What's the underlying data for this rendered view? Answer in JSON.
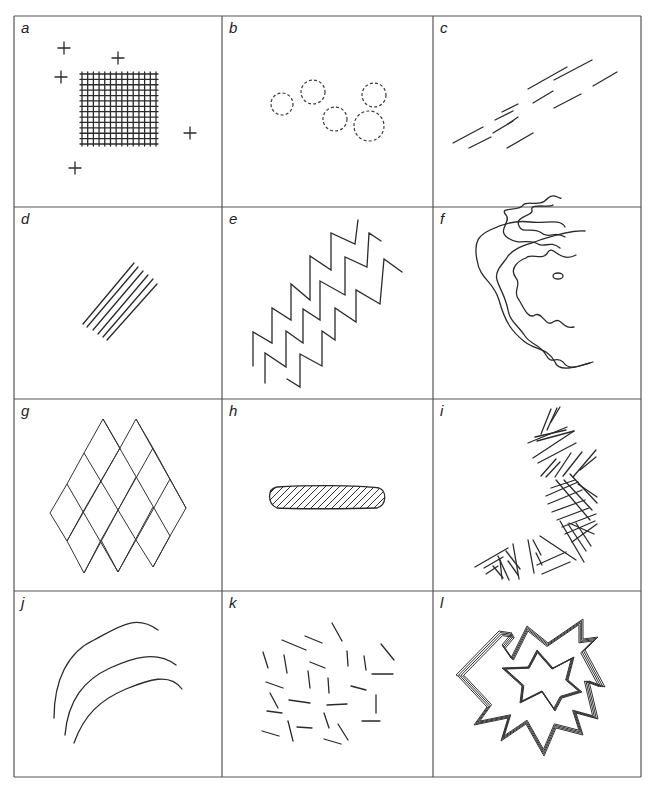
{
  "figure": {
    "type": "pattern-panel-grid",
    "rows": 4,
    "cols": 3,
    "frame": {
      "x0": 14,
      "y0": 16,
      "x1": 641,
      "y1": 777
    },
    "col_lines": [
      14,
      222,
      433,
      641
    ],
    "row_lines": [
      16,
      207,
      399,
      591,
      777
    ],
    "stroke_color": "#2a2a2a",
    "border_color": "#555555"
  },
  "panels": [
    {
      "id": "a",
      "label": "a",
      "description": "dense cross-hatched grid with scattered plus marks",
      "grid": {
        "x0": 80,
        "y0": 72,
        "x1": 158,
        "y1": 146,
        "vlines": 14,
        "hlines": 14
      },
      "plus_marks": [
        [
          64,
          48
        ],
        [
          118,
          58
        ],
        [
          61,
          77
        ],
        [
          190,
          133
        ],
        [
          75,
          168
        ]
      ]
    },
    {
      "id": "b",
      "label": "b",
      "description": "dashed circles",
      "circles": [
        [
          282,
          104,
          11
        ],
        [
          313,
          92,
          12
        ],
        [
          335,
          119,
          12
        ],
        [
          374,
          95,
          12
        ],
        [
          369,
          126,
          15
        ]
      ]
    },
    {
      "id": "c",
      "label": "c",
      "description": "short parallel dashes aligned on a diagonal",
      "segments": [
        [
          453,
          143,
          483,
          127
        ],
        [
          469,
          148,
          491,
          137
        ],
        [
          493,
          133,
          513,
          121
        ],
        [
          508,
          124,
          518,
          117
        ],
        [
          495,
          120,
          513,
          111
        ],
        [
          507,
          148,
          533,
          133
        ],
        [
          502,
          112,
          518,
          104
        ],
        [
          528,
          89,
          567,
          67
        ],
        [
          533,
          103,
          553,
          91
        ],
        [
          554,
          80,
          592,
          60
        ],
        [
          554,
          108,
          581,
          94
        ],
        [
          593,
          86,
          617,
          72
        ]
      ]
    },
    {
      "id": "d",
      "label": "d",
      "description": "bundle of parallel diagonal lines",
      "lines": [
        [
          83,
          324,
          134,
          263
        ],
        [
          87,
          327,
          138,
          267
        ],
        [
          93,
          330,
          143,
          271
        ],
        [
          98,
          334,
          148,
          275
        ],
        [
          103,
          337,
          153,
          279
        ],
        [
          107,
          340,
          157,
          284
        ]
      ]
    },
    {
      "id": "e",
      "label": "e",
      "description": "three parallel zigzag lines",
      "zigzags": [
        [
          [
            253,
            366
          ],
          [
            253,
            332
          ],
          [
            272,
            343
          ],
          [
            272,
            308
          ],
          [
            291,
            320
          ],
          [
            291,
            284
          ],
          [
            310,
            300
          ],
          [
            310,
            256
          ],
          [
            331,
            270
          ],
          [
            331,
            233
          ],
          [
            355,
            244
          ],
          [
            358,
            220
          ]
        ],
        [
          [
            265,
            383
          ],
          [
            265,
            353
          ],
          [
            286,
            367
          ],
          [
            286,
            331
          ],
          [
            303,
            343
          ],
          [
            303,
            309
          ],
          [
            320,
            320
          ],
          [
            320,
            281
          ],
          [
            345,
            295
          ],
          [
            345,
            257
          ],
          [
            367,
            267
          ],
          [
            369,
            233
          ],
          [
            381,
            241
          ]
        ],
        [
          [
            287,
            379
          ],
          [
            300,
            387
          ],
          [
            300,
            354
          ],
          [
            322,
            366
          ],
          [
            322,
            331
          ],
          [
            335,
            340
          ],
          [
            335,
            308
          ],
          [
            356,
            322
          ],
          [
            356,
            290
          ],
          [
            380,
            304
          ],
          [
            384,
            259
          ],
          [
            402,
            272
          ]
        ]
      ]
    },
    {
      "id": "f",
      "label": "f",
      "description": "concentric wavy contour lines",
      "contours": [
        "M 560 248 C 550 240 545 248 538 244 C 528 238 520 246 508 238 C 496 230 512 222 506 215 C 498 206 520 212 523 205 C 528 200 540 208 548 198 C 555 192 560 200 561 198",
        "M 565 237 C 555 230 550 240 540 232 C 532 227 522 234 519 226 C 514 216 534 216 532 210 C 529 203 550 208 553 205",
        "M 574 327 C 562 330 562 316 553 322 C 546 328 542 311 535 315 C 528 320 523 306 519 300 C 512 291 522 284 516 278 C 508 268 520 260 526 258 C 530 252 544 262 548 252 C 553 244 560 264 576 255",
        "M 590 363 C 580 365 570 372 563 362 C 556 355 552 366 546 355 C 540 344 531 345 525 336 C 518 325 510 322 508 310 C 505 295 500 290 497 280 C 494 270 505 262 508 256 C 516 246 530 244 540 240 C 553 236 570 230 585 231",
        "M 593 362 C 575 368 558 372 555 362 C 548 348 535 350 525 342 C 512 332 505 322 499 300 C 493 280 480 280 477 260 C 473 240 480 235 490 230 C 502 224 515 220 530 222 C 545 224 560 218 565 227"
      ]
    },
    {
      "id": "g",
      "label": "g",
      "description": "diamond (rhombus) lattice",
      "lattice": {
        "top_left": [
          103,
          419
        ],
        "u": [
          17,
          31
        ],
        "v": [
          -17,
          31
        ],
        "rows": 3,
        "cols": 3,
        "extra_right": true
      }
    },
    {
      "id": "h",
      "label": "h",
      "description": "elongated hatched lens shape",
      "shape": {
        "cx": 327,
        "cy": 497,
        "rx": 58,
        "ry": 11,
        "hatch_spacing": 7
      }
    },
    {
      "id": "i",
      "label": "i",
      "description": "chevron/herringbone line clusters along a curved belt",
      "segments": [
        [
          541,
          434,
          551,
          409
        ],
        [
          547,
          430,
          557,
          408
        ],
        [
          551,
          422,
          560,
          407
        ],
        [
          535,
          437,
          566,
          430
        ],
        [
          537,
          441,
          574,
          431
        ],
        [
          528,
          443,
          567,
          427
        ],
        [
          533,
          458,
          574,
          431
        ],
        [
          538,
          463,
          576,
          443
        ],
        [
          541,
          476,
          556,
          459
        ],
        [
          546,
          477,
          560,
          462
        ],
        [
          555,
          477,
          571,
          453
        ],
        [
          563,
          476,
          582,
          452
        ],
        [
          573,
          477,
          596,
          450
        ],
        [
          580,
          470,
          596,
          457
        ],
        [
          551,
          488,
          575,
          480
        ],
        [
          546,
          496,
          578,
          482
        ],
        [
          548,
          504,
          582,
          490
        ],
        [
          552,
          512,
          585,
          500
        ],
        [
          557,
          520,
          589,
          508
        ],
        [
          562,
          527,
          596,
          514
        ],
        [
          565,
          534,
          595,
          521
        ],
        [
          564,
          480,
          592,
          510
        ],
        [
          570,
          474,
          597,
          503
        ],
        [
          556,
          480,
          590,
          520
        ],
        [
          578,
          484,
          597,
          497
        ],
        [
          572,
          542,
          597,
          524
        ],
        [
          569,
          523,
          594,
          534
        ],
        [
          560,
          521,
          584,
          562
        ],
        [
          568,
          524,
          586,
          551
        ],
        [
          576,
          523,
          591,
          546
        ],
        [
          540,
          536,
          576,
          560
        ],
        [
          542,
          574,
          570,
          562
        ],
        [
          537,
          565,
          566,
          552
        ],
        [
          536,
          553,
          542,
          565
        ],
        [
          533,
          540,
          541,
          555
        ],
        [
          528,
          540,
          534,
          573
        ],
        [
          513,
          544,
          519,
          579
        ],
        [
          506,
          551,
          520,
          569
        ],
        [
          508,
          561,
          518,
          575
        ],
        [
          498,
          556,
          509,
          580
        ],
        [
          493,
          566,
          503,
          578
        ],
        [
          475,
          567,
          508,
          548
        ],
        [
          484,
          568,
          503,
          557
        ],
        [
          486,
          574,
          498,
          566
        ],
        [
          500,
          560,
          502,
          579
        ]
      ]
    },
    {
      "id": "j",
      "label": "j",
      "description": "three concentric curved arcs",
      "arcs": [
        "M 54 718 C 54 680 68 652 94 640 C 120 626 136 614 158 630",
        "M 65 735 C 68 700 84 680 110 668 C 132 658 156 650 176 665",
        "M 74 743 C 84 715 100 700 126 689 C 148 680 170 672 182 689"
      ]
    },
    {
      "id": "k",
      "label": "k",
      "description": "randomly oriented short line segments",
      "segments": [
        [
          282,
          640,
          306,
          650
        ],
        [
          305,
          636,
          322,
          643
        ],
        [
          332,
          623,
          342,
          641
        ],
        [
          263,
          652,
          268,
          668
        ],
        [
          284,
          655,
          287,
          673
        ],
        [
          310,
          662,
          325,
          668
        ],
        [
          347,
          651,
          348,
          666
        ],
        [
          364,
          656,
          366,
          670
        ],
        [
          381,
          644,
          394,
          660
        ],
        [
          372,
          674,
          393,
          674
        ],
        [
          308,
          671,
          310,
          688
        ],
        [
          328,
          678,
          329,
          693
        ],
        [
          266,
          682,
          283,
          688
        ],
        [
          270,
          693,
          278,
          708
        ],
        [
          289,
          700,
          310,
          703
        ],
        [
          327,
          705,
          347,
          704
        ],
        [
          351,
          686,
          366,
          690
        ],
        [
          376,
          695,
          376,
          713
        ],
        [
          267,
          711,
          282,
          713
        ],
        [
          288,
          721,
          293,
          741
        ],
        [
          297,
          727,
          312,
          728
        ],
        [
          324,
          713,
          329,
          728
        ],
        [
          338,
          724,
          348,
          740
        ],
        [
          362,
          721,
          380,
          721
        ],
        [
          262,
          731,
          279,
          736
        ],
        [
          324,
          739,
          341,
          744
        ]
      ]
    },
    {
      "id": "l",
      "label": "l",
      "description": "nested starburst outlines drawn with multiple parallel strokes",
      "outer_star": [
        [
          456,
          675
        ],
        [
          499,
          631
        ],
        [
          512,
          633
        ],
        [
          502,
          645
        ],
        [
          511,
          658
        ],
        [
          527,
          626
        ],
        [
          548,
          643
        ],
        [
          583,
          619
        ],
        [
          583,
          639
        ],
        [
          598,
          637
        ],
        [
          585,
          650
        ],
        [
          605,
          687
        ],
        [
          589,
          681
        ],
        [
          598,
          719
        ],
        [
          576,
          713
        ],
        [
          583,
          735
        ],
        [
          556,
          728
        ],
        [
          544,
          756
        ],
        [
          526,
          724
        ],
        [
          501,
          741
        ],
        [
          508,
          718
        ],
        [
          474,
          725
        ],
        [
          487,
          707
        ],
        [
          458,
          676
        ]
      ],
      "inner_star": [
        [
          502,
          668
        ],
        [
          528,
          667
        ],
        [
          537,
          650
        ],
        [
          553,
          668
        ],
        [
          574,
          657
        ],
        [
          568,
          680
        ],
        [
          582,
          692
        ],
        [
          562,
          698
        ],
        [
          555,
          711
        ],
        [
          542,
          692
        ],
        [
          520,
          703
        ],
        [
          522,
          686
        ],
        [
          502,
          668
        ]
      ]
    }
  ],
  "chart_data": null
}
